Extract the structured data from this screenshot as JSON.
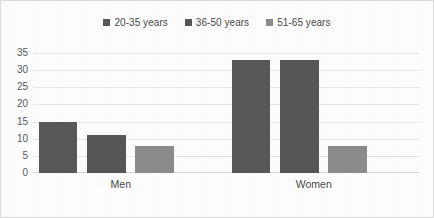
{
  "chart_data": {
    "type": "bar",
    "title": "",
    "subtitle": "",
    "xlabel": "",
    "ylabel": "",
    "categories": [
      "Men",
      "Women"
    ],
    "series": [
      {
        "name": "20-35 years",
        "values": [
          15,
          33
        ],
        "color": "#595959"
      },
      {
        "name": "36-50 years",
        "values": [
          11,
          33
        ],
        "color": "#575757"
      },
      {
        "name": "51-65 years",
        "values": [
          8,
          8
        ],
        "color": "#8c8c8c"
      }
    ],
    "ylim": [
      0,
      35
    ],
    "y_ticks": [
      35,
      30,
      25,
      20,
      15,
      10,
      5,
      0
    ],
    "grid": true,
    "legend_position": "top"
  },
  "figure": {
    "border_color": "#dcdcdc",
    "background": "#ffffff",
    "gridline_color": "#e8e8e8",
    "axis_text_color": "#595959"
  }
}
